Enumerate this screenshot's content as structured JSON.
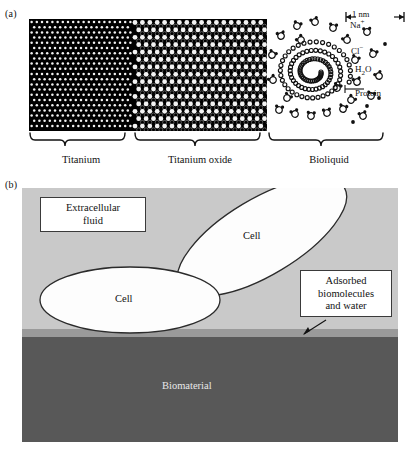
{
  "figure": {
    "panels": [
      {
        "id": "a",
        "label": "(a)"
      },
      {
        "id": "b",
        "label": "(b)"
      }
    ]
  },
  "panel_a": {
    "label": "(a)",
    "scalebar": {
      "text": "1 nm",
      "arrow_left": "←",
      "arrow_right": "→",
      "tick": "|"
    },
    "species": [
      {
        "name": "sodium-ion",
        "label_html": "Na",
        "superscript": "+"
      },
      {
        "name": "chloride-ion",
        "label_html": "Cl",
        "superscript": "−"
      },
      {
        "name": "water",
        "label_html": "H",
        "subscript": "2",
        "tail": "O"
      },
      {
        "name": "protein",
        "label_html": "Protein"
      }
    ],
    "labels": {
      "na": "Na",
      "na_sup": "+",
      "cl": "Cl",
      "cl_sup": "−",
      "h2o_pre": "H",
      "h2o_sub": "2",
      "h2o_post": "O",
      "protein": "Protein"
    },
    "regions": [
      {
        "name": "titanium",
        "label": "Titanium",
        "x_start": 29,
        "x_end": 133,
        "description": "dense black atomic lattice with small white interstitial dots"
      },
      {
        "name": "titanium-oxide",
        "label": "Titanium oxide",
        "x_start": 133,
        "x_end": 267,
        "description": "mixed lattice of black titanium atoms and larger white oxygen atoms"
      },
      {
        "name": "bioliquid",
        "label": "Bioliquid",
        "x_start": 267,
        "x_end": 391,
        "description": "water molecules, ions and a coiled protein"
      }
    ]
  },
  "panel_b": {
    "label": "(b)",
    "layers": [
      {
        "name": "extracellular-fluid",
        "label": "Extracellular\nfluid",
        "color": "#c9c9c9"
      },
      {
        "name": "adsorbed-layer",
        "label": "Adsorbed\nbiomolecules\nand water",
        "color": "#9a9a9a"
      },
      {
        "name": "biomaterial",
        "label": "Biomaterial",
        "color": "#585858"
      }
    ],
    "callouts": {
      "extracellular_fluid": {
        "line1": "Extracellular",
        "line2": "fluid"
      },
      "adsorbed": {
        "line1": "Adsorbed",
        "line2": "biomolecules",
        "line3": "and water"
      }
    },
    "cells": [
      {
        "name": "cell-upper",
        "label": "Cell",
        "cx": 262,
        "cy": 237,
        "rx": 96,
        "ry": 38,
        "rotation_deg": -31
      },
      {
        "name": "cell-lower",
        "label": "Cell",
        "cx": 130,
        "cy": 300,
        "rx": 90,
        "ry": 33,
        "rotation_deg": 0
      }
    ],
    "biomaterial_label": "Biomaterial"
  },
  "colors": {
    "background": "#ffffff",
    "ink": "#111111",
    "extracellular_fluid": "#c9c9c9",
    "adsorbed_layer": "#9a9a9a",
    "biomaterial": "#585858",
    "cell_fill": "#fdfdfd",
    "cell_stroke": "#2b2b2b",
    "box_border": "#3a3a3a",
    "lattice_black": "#000000",
    "lattice_white": "#f2f2f2"
  }
}
